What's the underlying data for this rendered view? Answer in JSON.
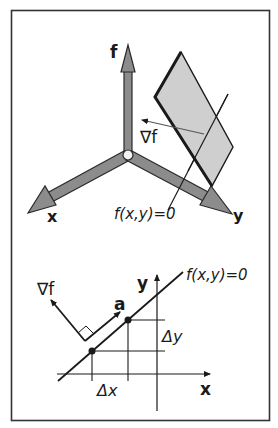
{
  "figure": {
    "frame_color": "#333333",
    "axis_fill": "#8c8c8c",
    "axis_stroke": "#2a2a2a",
    "plane_fill": "#cfcfcf",
    "plane_stroke": "#1a1a1a"
  },
  "top_panel": {
    "axis_labels": {
      "f": "f",
      "x": "x",
      "y": "y"
    },
    "gradient_label": "∇f",
    "surface_label": "f(x,y)=0"
  },
  "bottom_panel": {
    "axis_labels": {
      "x": "x",
      "y": "y"
    },
    "gradient_label": "∇f",
    "vector_label": "a",
    "curve_label": "f(x,y)=0",
    "delta_x_label": "Δx",
    "delta_y_label": "Δy"
  }
}
